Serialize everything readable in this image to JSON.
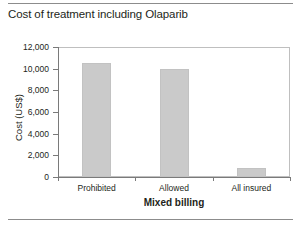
{
  "chart_data": {
    "type": "bar",
    "title": "Cost of treatment including Olaparib",
    "xlabel": "Mixed billing",
    "ylabel": "Cost (US$)",
    "categories": [
      "Prohibited",
      "Allowed",
      "All insured"
    ],
    "values": [
      10500,
      10000,
      830
    ],
    "ylim": [
      0,
      12000
    ],
    "yticks": [
      0,
      2000,
      4000,
      6000,
      8000,
      10000,
      12000
    ],
    "ytick_labels": [
      "0",
      "2,000",
      "4,000",
      "6,000",
      "8,000",
      "10,000",
      "12,000"
    ],
    "grid": false,
    "legend": false,
    "bar_color": "#cacaca",
    "axis_color": "#7a7a7a",
    "text_color": "#231f20",
    "series": [
      {
        "name": "Cost of treatment including Olaparib",
        "values": [
          10500,
          10000,
          830
        ]
      }
    ]
  }
}
